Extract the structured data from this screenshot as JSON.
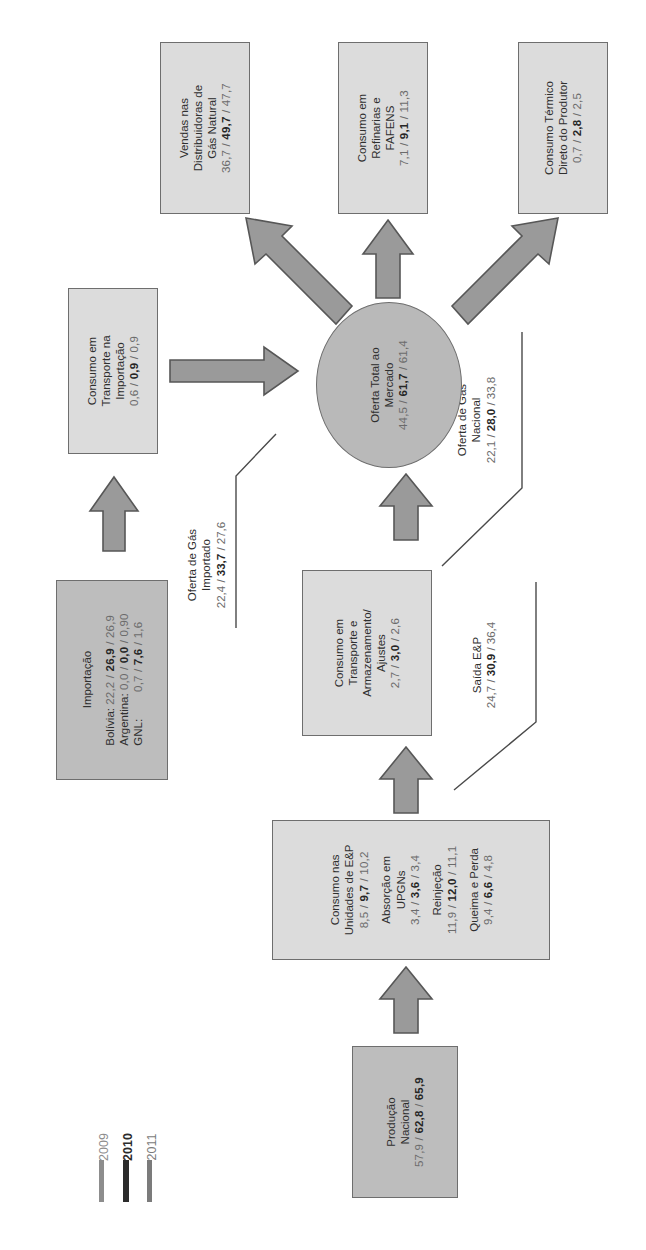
{
  "diagram": {
    "legend": {
      "items": [
        {
          "label": "2009",
          "color": "#8d8d8d",
          "weight": "normal"
        },
        {
          "label": "2010",
          "color": "#2b2b2b",
          "weight": "bold"
        },
        {
          "label": "2011",
          "color": "#7b7b7b",
          "weight": "normal"
        }
      ]
    },
    "nodes": {
      "producao_nacional": {
        "name": "Produção Nacional",
        "lines": [
          "Produção",
          "Nacional"
        ],
        "values": "57,9 / 62,8 / 65,9",
        "v2009": "57,9",
        "v2010": "62,8",
        "v2011": "65,9"
      },
      "consumo_ep": {
        "name": "Consumo nas Unidades de E&P",
        "groups": [
          {
            "lines": [
              "Consumo nas",
              "Unidades de E&P"
            ],
            "values": "8,5 / 9,7 / 10,2",
            "v2009": "8,5",
            "v2010": "9,7",
            "v2011": "10,2"
          },
          {
            "lines": [
              "Absorção em",
              "UPGNs"
            ],
            "values": "3,4 / 3,6 / 3,4",
            "v2009": "3,4",
            "v2010": "3,6",
            "v2011": "3,4"
          },
          {
            "lines": [
              "Reinjeção"
            ],
            "values": "11,9 / 12,0 / 11,1",
            "v2009": "11,9",
            "v2010": "12,0",
            "v2011": "11,1"
          },
          {
            "lines": [
              "Queima e Perda"
            ],
            "values": "9,4 / 6,6 / 4,8",
            "v2009": "9,4",
            "v2010": "6,6",
            "v2011": "4,8"
          }
        ]
      },
      "consumo_transporte_armazenamento": {
        "name": "Consumo em Transporte e Armazenamento/Ajustes",
        "lines": [
          "Consumo em",
          "Transporte e",
          "Armazenamento/",
          "Ajustes"
        ],
        "values": "2,7 / 3,0 / 2,6",
        "v2009": "2,7",
        "v2010": "3,0",
        "v2011": "2,6"
      },
      "importacao": {
        "name": "Importação",
        "lines": [
          "Importação"
        ],
        "rows": [
          {
            "label": "Bolívia:",
            "values": "22,2 / 26,9 / 26,9",
            "v2009": "22,2",
            "v2010": "26,9",
            "v2011": "26,9"
          },
          {
            "label": "Argentina:",
            "values": "0,0 / 0,0 / 0,90",
            "v2009": "0,0",
            "v2010": "0,0",
            "v2011": "0,90"
          },
          {
            "label": "GNL:",
            "values": "0,7 / 7,6 / 1,6",
            "v2009": "0,7",
            "v2010": "7,6",
            "v2011": "1,6"
          }
        ]
      },
      "consumo_transporte_importacao": {
        "name": "Consumo em Transporte na Importação",
        "lines": [
          "Consumo em",
          "Transporte na",
          "Importação"
        ],
        "values": "0,6 / 0,9 / 0,9",
        "v2009": "0,6",
        "v2010": "0,9",
        "v2011": "0,9"
      },
      "oferta_total": {
        "name": "Oferta Total ao Mercado",
        "lines": [
          "Oferta Total ao",
          "Mercado"
        ],
        "values": "44,5 / 61,7 / 61,4",
        "v2009": "44,5",
        "v2010": "61,7",
        "v2011": "61,4"
      },
      "vendas_distribuidoras": {
        "name": "Vendas nas Distribuidoras de Gás Natural",
        "lines": [
          "Vendas nas",
          "Distribuidoras de",
          "Gás Natural"
        ],
        "values": "36,7 / 49,7 / 47,7",
        "v2009": "36,7",
        "v2010": "49,7",
        "v2011": "47,7"
      },
      "consumo_refinarias": {
        "name": "Consumo em Refinarias e FAFENS",
        "lines": [
          "Consumo em",
          "Refinarias e",
          "FAFENS"
        ],
        "values": "7,1 / 9,1 / 11,3",
        "v2009": "7,1",
        "v2010": "9,1",
        "v2011": "11,3"
      },
      "consumo_termico": {
        "name": "Consumo Térmico Direto do Produtor",
        "lines": [
          "Consumo Térmico",
          "Direto do Produtor"
        ],
        "values": "0,7 / 2,8 / 2,5",
        "v2009": "0,7",
        "v2010": "2,8",
        "v2011": "2,5"
      }
    },
    "flow_labels": {
      "saida_ep": {
        "name": "Saída E&P",
        "lines": [
          "Saída E&P"
        ],
        "values": "24,7 / 30,9 / 36,4",
        "v2009": "24,7",
        "v2010": "30,9",
        "v2011": "36,4"
      },
      "oferta_gas_nacional": {
        "name": "Oferta de Gás Nacional",
        "lines": [
          "Oferta de Gás",
          "Nacional"
        ],
        "values": "22,1 / 28,0 / 33,8",
        "v2009": "22,1",
        "v2010": "28,0",
        "v2011": "33,8"
      },
      "oferta_gas_importado": {
        "name": "Oferta de Gás Importado",
        "lines": [
          "Oferta de Gás",
          "Importado"
        ],
        "values": "22,4 / 33,7 / 27,6",
        "v2009": "22,4",
        "v2010": "33,7",
        "v2011": "27,6"
      }
    },
    "colors": {
      "box_fill_light": "#dcdcdc",
      "box_fill_dark": "#bdbdbd",
      "box_border": "#6e6e6e",
      "arrow_fill": "#9a9a9a",
      "arrow_border": "#575757",
      "text": "#333333",
      "value_text": "#6b6b6b"
    }
  }
}
